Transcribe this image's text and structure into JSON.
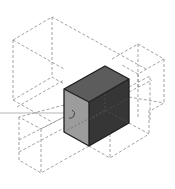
{
  "diagram": {
    "type": "isometric-box-arrangement",
    "colors": {
      "background": "#ffffff",
      "dashed_outline": "#8a8a8a",
      "solid_top": "#5c5c5c",
      "solid_left": "#9c9c9c",
      "solid_right": "#363636",
      "edge": "#1e1e1e",
      "guide_line": "#9a9a9a"
    },
    "solid_box": {
      "label": "",
      "top": [
        [
          64,
          89
        ],
        [
          105,
          66
        ],
        [
          129,
          79
        ],
        [
          89,
          102
        ]
      ],
      "left": [
        [
          64,
          89
        ],
        [
          89,
          102
        ],
        [
          89,
          146
        ],
        [
          64,
          132
        ]
      ],
      "right": [
        [
          89,
          102
        ],
        [
          129,
          79
        ],
        [
          129,
          123
        ],
        [
          89,
          146
        ]
      ]
    },
    "ghost_boxes": [
      {
        "name": "upper-left-box",
        "points": [
          [
            13,
            40
          ],
          [
            52,
            17
          ],
          [
            52,
            77
          ],
          [
            13,
            100
          ]
        ]
      },
      {
        "name": "upper-right-box",
        "points": [
          [
            138,
            44
          ],
          [
            164,
            59
          ],
          [
            164,
            103
          ],
          [
            138,
            88
          ]
        ]
      },
      {
        "name": "lower-left-box",
        "points": [
          [
            19,
            117
          ],
          [
            41,
            129
          ],
          [
            41,
            173
          ],
          [
            19,
            160
          ]
        ]
      },
      {
        "name": "lower-right-box",
        "points": [
          [
            110,
            120
          ],
          [
            149,
            140
          ],
          [
            110,
            163
          ],
          [
            71,
            143
          ]
        ]
      }
    ],
    "guide_line": {
      "x1": 0,
      "y1": 113,
      "x2": 79,
      "y2": 113
    }
  }
}
